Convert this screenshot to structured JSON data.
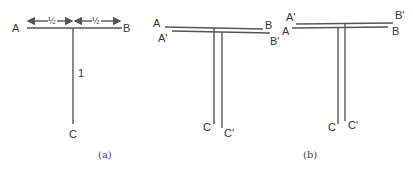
{
  "panel_a": {
    "caption": "(a)",
    "labels": {
      "A": "A",
      "B": "B",
      "C": "C"
    },
    "dimension_left": "½",
    "dimension_right": "½",
    "stem_length": "1"
  },
  "panel_b": {
    "caption": "(b)",
    "left": {
      "labels": {
        "A": "A",
        "B": "B",
        "A_prime": "A'",
        "B_prime": "B'",
        "C": "C",
        "C_prime": "C'"
      }
    },
    "right": {
      "labels": {
        "A": "A",
        "B": "B",
        "A_prime": "A'",
        "B_prime": "B'",
        "C": "C",
        "C_prime": "C'"
      }
    }
  },
  "colors": {
    "line": "#555555",
    "text": "#333333"
  }
}
